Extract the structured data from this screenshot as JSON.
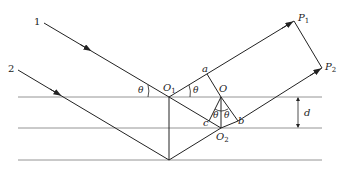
{
  "figure": {
    "type": "thin-film interference diagram",
    "colors": {
      "line": "#222222",
      "surface": "#888888",
      "background": "#ffffff"
    }
  },
  "labels": {
    "ray1": "1",
    "ray2": "2",
    "O1": {
      "main": "O",
      "sub": "1"
    },
    "O": "O",
    "O2": {
      "main": "O",
      "sub": "2"
    },
    "a": "a",
    "b": "b",
    "c": "c",
    "P1": {
      "main": "P",
      "sub": "1"
    },
    "P2": {
      "main": "P",
      "sub": "2"
    },
    "d": "d",
    "theta_left": "θ",
    "theta_right": "θ",
    "theta_inner_left": "θ",
    "theta_inner_right": "θ"
  }
}
